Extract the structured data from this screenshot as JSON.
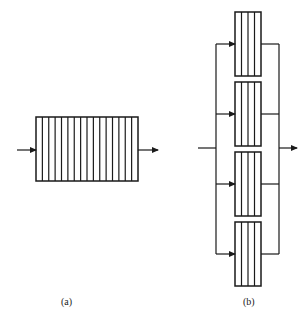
{
  "diagram": {
    "colors": {
      "line": "#1a1a1a",
      "background": "#ffffff"
    },
    "panel_a": {
      "label": "(a)",
      "box": {
        "x": 36,
        "y": 117,
        "w": 102,
        "h": 64,
        "cells": 16
      },
      "input_arrow": {
        "x1": 17,
        "x2": 36,
        "y": 150
      },
      "output_arrow": {
        "x1": 138,
        "x2": 158,
        "y": 150
      }
    },
    "panel_b": {
      "label": "(b)",
      "bus_left_x": 216,
      "bus_right_x": 279,
      "input_line": {
        "x1": 198,
        "y": 148
      },
      "output_arrow": {
        "x2": 297,
        "y": 148
      },
      "boxes": [
        {
          "x": 235,
          "y": 12,
          "w": 26,
          "h": 64,
          "cells": 4,
          "branch_y": 44
        },
        {
          "x": 235,
          "y": 82,
          "w": 26,
          "h": 64,
          "cells": 4,
          "branch_y": 114
        },
        {
          "x": 235,
          "y": 152,
          "w": 26,
          "h": 64,
          "cells": 4,
          "branch_y": 184
        },
        {
          "x": 235,
          "y": 222,
          "w": 26,
          "h": 64,
          "cells": 4,
          "branch_y": 254
        }
      ]
    }
  }
}
